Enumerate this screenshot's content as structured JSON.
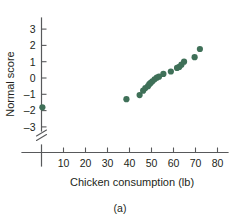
{
  "chart_data": {
    "type": "scatter",
    "title": "",
    "xlabel": "Chicken consumption (lb)",
    "ylabel": "Normal score",
    "caption": "(a)",
    "xlim": [
      0,
      84
    ],
    "ylim": [
      -3.6,
      3.4
    ],
    "xticks": [
      10,
      20,
      30,
      40,
      50,
      60,
      70,
      80
    ],
    "yticks": [
      3,
      2,
      1,
      0,
      -1,
      -2,
      -3
    ],
    "xtick_labels": [
      "10",
      "20",
      "30",
      "40",
      "50",
      "60",
      "70",
      "80"
    ],
    "ytick_labels": [
      "3",
      "2",
      "1",
      "0",
      "–1",
      "–2",
      "–3"
    ],
    "grid": false,
    "legend": "none",
    "axis_break": {
      "axis": "y",
      "below": -3.2
    },
    "marker": {
      "shape": "circle",
      "color": "#3f7058",
      "radius": 3.1
    },
    "series": [
      {
        "name": "Chicken consumption vs normal score",
        "points": [
          [
            0.4,
            -1.8
          ],
          [
            38.6,
            -1.3
          ],
          [
            44.6,
            -1.05
          ],
          [
            46.2,
            -0.78
          ],
          [
            47.2,
            -0.62
          ],
          [
            48.4,
            -0.5
          ],
          [
            49.0,
            -0.38
          ],
          [
            49.6,
            -0.3
          ],
          [
            50.4,
            -0.2
          ],
          [
            51.4,
            -0.08
          ],
          [
            52.4,
            0.02
          ],
          [
            53.4,
            0.08
          ],
          [
            55.4,
            0.25
          ],
          [
            58.8,
            0.4
          ],
          [
            61.6,
            0.62
          ],
          [
            62.6,
            0.68
          ],
          [
            63.6,
            0.82
          ],
          [
            64.8,
            1.0
          ],
          [
            69.6,
            1.28
          ],
          [
            72.0,
            1.78
          ]
        ]
      }
    ]
  }
}
